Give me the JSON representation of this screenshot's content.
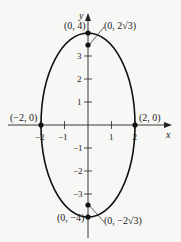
{
  "diagram": {
    "type": "ellipse-plot",
    "equation_implied": "x^2/4 + y^2/16 = 1",
    "axes": {
      "x_label": "x",
      "y_label": "y",
      "x_ticks": [
        {
          "value": -2,
          "label": "−2"
        },
        {
          "value": -1,
          "label": "−1"
        },
        {
          "value": 1,
          "label": "1"
        },
        {
          "value": 2,
          "label": "2"
        }
      ],
      "y_ticks": [
        {
          "value": 3,
          "label": "3"
        },
        {
          "value": 2,
          "label": "2"
        },
        {
          "value": 1,
          "label": "1"
        },
        {
          "value": -1,
          "label": "−1"
        },
        {
          "value": -2,
          "label": "−2"
        },
        {
          "value": -3,
          "label": "−3"
        }
      ]
    },
    "points": {
      "top_vertex": {
        "x": 0,
        "y": 4,
        "label": "(0, 4)"
      },
      "top_focus": {
        "x": 0,
        "y": 3.4641,
        "label": "(0, 2√3)"
      },
      "left_covertex": {
        "x": -2,
        "y": 0,
        "label": "(−2, 0)"
      },
      "right_covertex": {
        "x": 2,
        "y": 0,
        "label": "(2, 0)"
      },
      "bottom_vertex": {
        "x": 0,
        "y": -4,
        "label": "(0, −4)"
      },
      "bottom_focus": {
        "x": 0,
        "y": -3.4641,
        "label": "(0, −2√3)"
      }
    },
    "colors": {
      "curve": "#111111",
      "background": "#f7f7f5"
    }
  }
}
